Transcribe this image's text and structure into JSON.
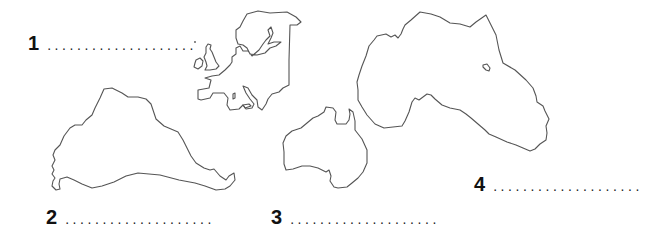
{
  "worksheet": {
    "items": [
      {
        "number": "1",
        "answer_placeholder": "....................",
        "shape": "europe-outline"
      },
      {
        "number": "2",
        "answer_placeholder": "....................",
        "shape": "south-america-outline"
      },
      {
        "number": "3",
        "answer_placeholder": "....................",
        "shape": "australia-outline"
      },
      {
        "number": "4",
        "answer_placeholder": "....................",
        "shape": "africa-outline"
      }
    ],
    "colors": {
      "background": "#ffffff",
      "outline": "#555555",
      "text": "#111111"
    }
  }
}
